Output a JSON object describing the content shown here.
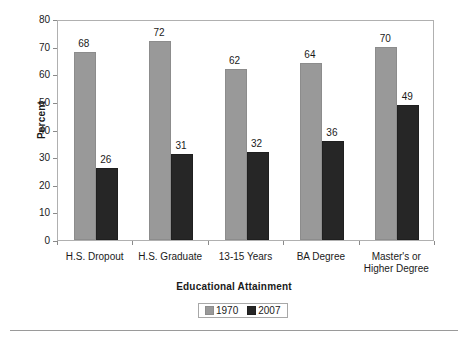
{
  "chart_data": {
    "type": "bar",
    "title": "",
    "xlabel": "Educational Attainment",
    "ylabel": "Percent",
    "categories": [
      "H.S. Dropout",
      "H.S. Graduate",
      "13-15 Years",
      "BA Degree",
      "Master's or Higher Degree"
    ],
    "category_lines": [
      [
        "H.S. Dropout"
      ],
      [
        "H.S. Graduate"
      ],
      [
        "13-15 Years"
      ],
      [
        "BA Degree"
      ],
      [
        "Master's or",
        "Higher Degree"
      ]
    ],
    "series": [
      {
        "name": "1970",
        "color": "#999999",
        "values": [
          68,
          72,
          62,
          64,
          70
        ]
      },
      {
        "name": "2007",
        "color": "#262626",
        "values": [
          26,
          31,
          32,
          36,
          49
        ]
      }
    ],
    "ylim": [
      0,
      80
    ],
    "ytick_values": [
      0,
      10,
      20,
      30,
      40,
      50,
      60,
      70,
      80
    ],
    "ytick_labels": [
      "0",
      "10",
      "20",
      "30",
      "40",
      "50",
      "60",
      "70",
      "80"
    ],
    "grid": false,
    "data_labels": true,
    "legend": {
      "position": "bottom-center",
      "boxed": true,
      "entries": [
        "1970",
        "2007"
      ]
    }
  },
  "axis": {
    "y_title": "Percent",
    "x_title": "Educational Attainment"
  }
}
